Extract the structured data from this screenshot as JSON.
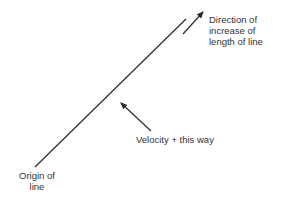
{
  "diagram": {
    "labels": {
      "direction": [
        "Direction of",
        "increase of",
        "length of line"
      ],
      "velocity": "Velocity + this way",
      "origin": [
        "Origin of",
        "line"
      ]
    },
    "colors": {
      "line": "#2a2a2a",
      "text": "#333333",
      "background": "#ffffff"
    }
  }
}
